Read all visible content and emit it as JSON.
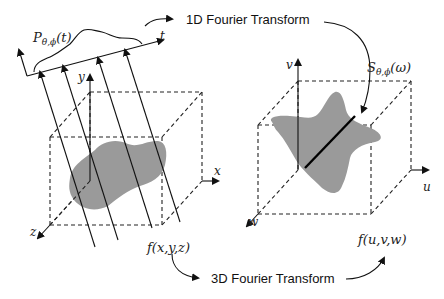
{
  "labels": {
    "projection": "P",
    "projection_sub": "θ,ϕ",
    "projection_arg": "(t)",
    "t_axis": "t",
    "y_axis": "y",
    "x_axis": "x",
    "z_axis": "z",
    "spatial_function": "f(x,y,z)",
    "slice": "S",
    "slice_sub": "θ,ϕ",
    "slice_arg": "(ω)",
    "v_axis": "v",
    "u_axis": "u",
    "w_axis": "w",
    "frequency_function": "f(u,v,w)",
    "transform_1d": "1D Fourier Transform",
    "transform_3d": "3D Fourier Transform"
  },
  "colors": {
    "object_fill": "#9a9a9a",
    "line": "#111111",
    "background": "#ffffff"
  }
}
